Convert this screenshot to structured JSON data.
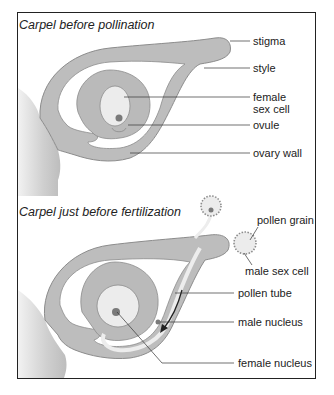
{
  "panels": [
    {
      "title": "Carpel before pollination",
      "labels": {
        "stigma": "stigma",
        "style": "style",
        "female_sex_cell_1": "female",
        "female_sex_cell_2": "sex cell",
        "ovule": "ovule",
        "ovary_wall": "ovary wall"
      }
    },
    {
      "title": "Carpel just before fertilization",
      "labels": {
        "pollen_grain": "pollen grain",
        "male_sex_cell": "male sex cell",
        "pollen_tube": "pollen tube",
        "male_nucleus": "male nucleus",
        "female_nucleus": "female nucleus"
      }
    }
  ],
  "colors": {
    "tissue": "#bdbdbd",
    "tissue_outline": "#8c8c8c",
    "cell": "#ececec",
    "nucleus": "#7a7a7a",
    "line": "#333333"
  }
}
